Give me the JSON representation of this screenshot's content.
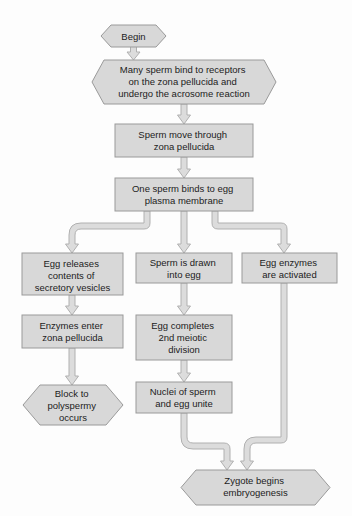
{
  "diagram": {
    "colors": {
      "node_fill": "#d8d8d8",
      "node_stroke": "#9a9a9a",
      "connector_fill": "#dcdcdc",
      "connector_stroke": "#b0b0b0",
      "text": "#1c1c1c",
      "background": "#fdfdfd"
    },
    "nodes": [
      {
        "id": "begin",
        "shape": "hexagon",
        "lines": [
          "Begin"
        ]
      },
      {
        "id": "many-sperm-bind",
        "shape": "hexagon",
        "lines": [
          "Many sperm bind to receptors",
          "on the zona pellucida and",
          "undergo the acrosome reaction"
        ]
      },
      {
        "id": "sperm-move-through",
        "shape": "rectangle",
        "lines": [
          "Sperm move through",
          "zona pellucida"
        ]
      },
      {
        "id": "one-sperm-binds",
        "shape": "rectangle",
        "lines": [
          "One sperm binds to egg",
          "plasma membrane"
        ]
      },
      {
        "id": "egg-releases-contents",
        "shape": "rectangle",
        "lines": [
          "Egg releases",
          "contents of",
          "secretory vesicles"
        ]
      },
      {
        "id": "sperm-drawn-into-egg",
        "shape": "rectangle",
        "lines": [
          "Sperm is drawn",
          "into egg"
        ]
      },
      {
        "id": "egg-enzymes-activated",
        "shape": "rectangle",
        "lines": [
          "Egg enzymes",
          "are activated"
        ]
      },
      {
        "id": "enzymes-enter-zona",
        "shape": "rectangle",
        "lines": [
          "Enzymes enter",
          "zona pellucida"
        ]
      },
      {
        "id": "egg-completes-meiosis",
        "shape": "rectangle",
        "lines": [
          "Egg completes",
          "2nd meiotic",
          "division"
        ]
      },
      {
        "id": "block-to-polyspermy",
        "shape": "hexagon",
        "lines": [
          "Block to",
          "polyspermy",
          "occurs"
        ]
      },
      {
        "id": "nuclei-unite",
        "shape": "rectangle",
        "lines": [
          "Nuclei of sperm",
          "and egg unite"
        ]
      },
      {
        "id": "zygote-begins",
        "shape": "hexagon",
        "lines": [
          "Zygote begins",
          "embryogenesis"
        ]
      }
    ],
    "edges": [
      {
        "from": "begin",
        "to": "many-sperm-bind",
        "style": "straight-arrow"
      },
      {
        "from": "many-sperm-bind",
        "to": "sperm-move-through",
        "style": "straight-arrow"
      },
      {
        "from": "sperm-move-through",
        "to": "one-sperm-binds",
        "style": "straight-arrow"
      },
      {
        "from": "one-sperm-binds",
        "to": "egg-releases-contents",
        "style": "elbow-left-arrow"
      },
      {
        "from": "one-sperm-binds",
        "to": "sperm-drawn-into-egg",
        "style": "straight-arrow"
      },
      {
        "from": "one-sperm-binds",
        "to": "egg-enzymes-activated",
        "style": "elbow-right-arrow"
      },
      {
        "from": "egg-releases-contents",
        "to": "enzymes-enter-zona",
        "style": "straight-arrow"
      },
      {
        "from": "enzymes-enter-zona",
        "to": "block-to-polyspermy",
        "style": "straight-arrow"
      },
      {
        "from": "sperm-drawn-into-egg",
        "to": "egg-completes-meiosis",
        "style": "straight-arrow"
      },
      {
        "from": "egg-completes-meiosis",
        "to": "nuclei-unite",
        "style": "straight-arrow"
      },
      {
        "from": "nuclei-unite",
        "to": "zygote-begins",
        "style": "elbow-right-arrow"
      },
      {
        "from": "egg-enzymes-activated",
        "to": "zygote-begins",
        "style": "elbow-left-arrow"
      }
    ]
  }
}
